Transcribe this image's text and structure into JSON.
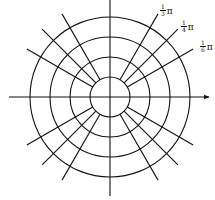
{
  "diagram": {
    "type": "polar-grid",
    "center": [
      110,
      97
    ],
    "circle_radii": [
      20,
      40,
      60,
      80
    ],
    "ray_inner_radius": 20,
    "ray_outer_radius": 96,
    "ray_angles_deg": [
      30,
      45,
      60
    ],
    "stroke_color": "#111111",
    "labels": [
      {
        "num": "1",
        "den": "3",
        "suffix": "π",
        "angle": "π/3"
      },
      {
        "num": "1",
        "den": "4",
        "suffix": "π",
        "angle": "π/4"
      },
      {
        "num": "1",
        "den": "6",
        "suffix": "π",
        "angle": "π/6"
      }
    ]
  }
}
